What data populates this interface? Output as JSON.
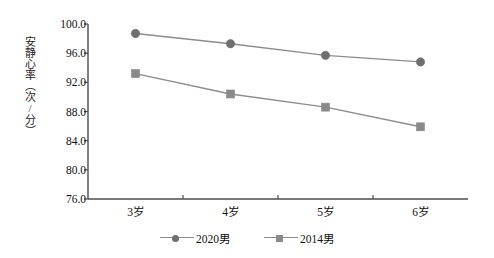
{
  "chart_data": {
    "type": "line",
    "title": "",
    "xlabel": "",
    "ylabel": "安静心率（次/分）",
    "categories": [
      "3岁",
      "4岁",
      "5岁",
      "6岁"
    ],
    "ylim": [
      76.0,
      100.0
    ],
    "ytick_labels": [
      "76.0",
      "80.0",
      "84.0",
      "88.0",
      "92.0",
      "96.0",
      "100.0"
    ],
    "ytick_values": [
      76.0,
      80.0,
      84.0,
      88.0,
      92.0,
      96.0,
      100.0
    ],
    "grid": false,
    "legend_position": "bottom",
    "series": [
      {
        "name": "2020男",
        "marker": "circle",
        "color": "#6f6f6f",
        "values": [
          98.7,
          97.3,
          95.7,
          94.8
        ]
      },
      {
        "name": "2014男",
        "marker": "square",
        "color": "#8a8a8a",
        "values": [
          93.2,
          90.4,
          88.6,
          85.9
        ]
      }
    ]
  },
  "colors": {
    "axis": "#4d4d4d",
    "line": "#8c8c8c",
    "marker_circle": "#6f6f6f",
    "marker_square": "#8a8a8a",
    "text": "#111111",
    "background": "#ffffff"
  },
  "legend": {
    "items": [
      {
        "label": "2020男",
        "marker": "circle-marker-icon"
      },
      {
        "label": "2014男",
        "marker": "square-marker-icon"
      }
    ]
  }
}
